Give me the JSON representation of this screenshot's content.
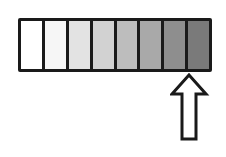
{
  "diagram": {
    "type": "gradient-scale",
    "cells": [
      {
        "index": 1,
        "color": "#ffffff"
      },
      {
        "index": 2,
        "color": "#f6f6f6"
      },
      {
        "index": 3,
        "color": "#e3e3e3"
      },
      {
        "index": 4,
        "color": "#d2d2d2"
      },
      {
        "index": 5,
        "color": "#bdbdbd"
      },
      {
        "index": 6,
        "color": "#a9a9a9"
      },
      {
        "index": 7,
        "color": "#8e8e8e"
      },
      {
        "index": 8,
        "color": "#7a7a7a"
      }
    ],
    "arrow": {
      "direction": "up",
      "points_to_cell": 8,
      "icon": "up-arrow-icon"
    }
  }
}
